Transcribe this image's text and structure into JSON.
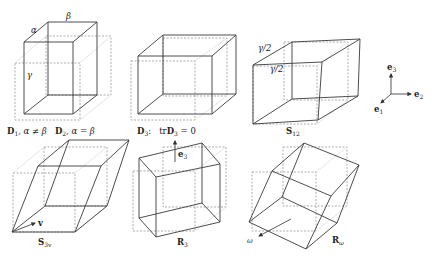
{
  "figure": {
    "panels": [
      {
        "id": "D1_D2",
        "caption_parts": [
          "D",
          "1",
          ", α ≠ β",
          "D",
          "2",
          ", α = β"
        ],
        "edge_labels": [
          "α",
          "β",
          "γ"
        ]
      },
      {
        "id": "D3",
        "caption_parts": [
          "D",
          "3",
          ":",
          "tr",
          "D",
          "3",
          " = 0"
        ]
      },
      {
        "id": "S12",
        "caption_parts": [
          "S",
          "12"
        ],
        "edge_labels": [
          "γ/2",
          "γ/2"
        ]
      },
      {
        "id": "S3v",
        "caption_parts": [
          "S",
          "3v"
        ],
        "vector_label": "v"
      },
      {
        "id": "R3",
        "caption_parts": [
          "R",
          "3"
        ],
        "vector_label_parts": [
          "e",
          "3"
        ]
      },
      {
        "id": "Rw",
        "caption_parts": [
          "R",
          "ω"
        ],
        "vector_label": "ω"
      }
    ],
    "axes": {
      "e1": [
        "e",
        "1"
      ],
      "e2": [
        "e",
        "2"
      ],
      "e3": [
        "e",
        "3"
      ]
    }
  }
}
